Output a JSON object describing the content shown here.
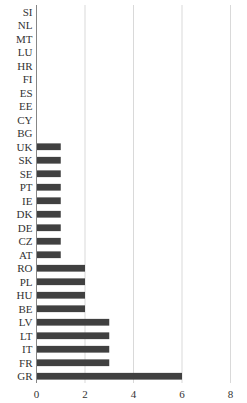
{
  "chart_data": {
    "type": "bar",
    "orientation": "horizontal",
    "title": "",
    "xlabel": "",
    "ylabel": "",
    "categories": [
      "SI",
      "NL",
      "MT",
      "LU",
      "HR",
      "FI",
      "ES",
      "EE",
      "CY",
      "BG",
      "UK",
      "SK",
      "SE",
      "PT",
      "IE",
      "DK",
      "DE",
      "CZ",
      "AT",
      "RO",
      "PL",
      "HU",
      "BE",
      "LV",
      "LT",
      "IT",
      "FR",
      "GR"
    ],
    "values": [
      0,
      0,
      0,
      0,
      0,
      0,
      0,
      0,
      0,
      0,
      1,
      1,
      1,
      1,
      1,
      1,
      1,
      1,
      1,
      2,
      2,
      2,
      2,
      3,
      3,
      3,
      3,
      6
    ],
    "xlim": [
      0,
      8
    ],
    "xticks": [
      0,
      2,
      4,
      6,
      8
    ],
    "xtick_labels": [
      "0",
      "2",
      "4",
      "6",
      "8"
    ],
    "grid": "vertical",
    "legend": "none",
    "bar_color": "#404040",
    "grid_color": "#d9d9d9",
    "axis_color": "#868686"
  }
}
